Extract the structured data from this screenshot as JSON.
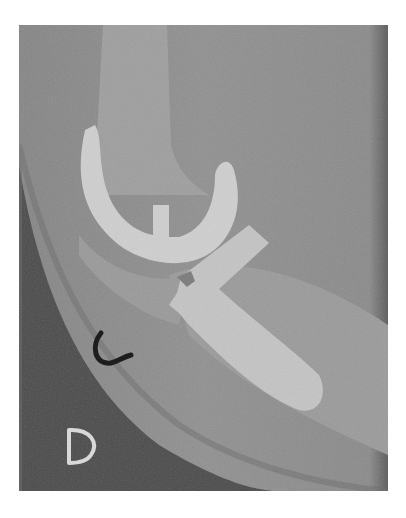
{
  "image": {
    "kind": "lateral knee radiograph with total knee prosthesis",
    "markers": {
      "letter": "D",
      "arc_marker": "C"
    },
    "colors": {
      "background": "#ffffff",
      "soft_tissue": "#8c8c8c",
      "dark_region": "#4a4a4a",
      "implant": "#cfcfcf",
      "marker_dark": "#1e1e1e",
      "marker_light": "#d8d8d8"
    }
  }
}
